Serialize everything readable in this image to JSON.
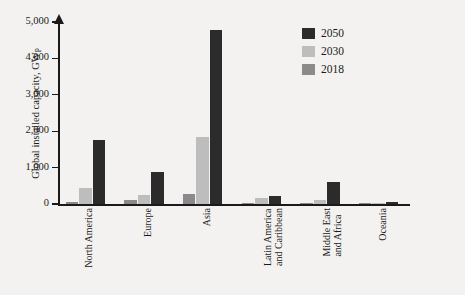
{
  "chart_data": {
    "type": "bar",
    "title": "",
    "xlabel": "",
    "ylabel": "Global installed capacity, GW",
    "ylabel_subscript": "P",
    "ylim": [
      0,
      5000
    ],
    "yticks": [
      0,
      1000,
      2000,
      3000,
      4000,
      5000
    ],
    "ytick_labels": [
      "0",
      "1,000",
      "2,000",
      "3,000",
      "4,000",
      "5,000"
    ],
    "grid": false,
    "legend_position": "top-right",
    "categories": [
      "North America",
      "Europe",
      "Asia",
      "Latin America and Caribbean",
      "Middle East and Africa",
      "Oceania"
    ],
    "category_lines": [
      [
        "North America"
      ],
      [
        "Europe"
      ],
      [
        "Asia"
      ],
      [
        "Latin America",
        "and Caribbean"
      ],
      [
        "Middle East",
        "and Africa"
      ],
      [
        "Oceania"
      ]
    ],
    "series": [
      {
        "name": "2018",
        "color": "#8a8a8a",
        "values": [
          62,
          115,
          265,
          7,
          12,
          11
        ]
      },
      {
        "name": "2030",
        "color": "#bdbdbd",
        "values": [
          430,
          245,
          1845,
          175,
          120,
          30
        ]
      },
      {
        "name": "2050",
        "color": "#2b2b2b",
        "values": [
          1745,
          880,
          4775,
          210,
          600,
          55
        ]
      }
    ],
    "series_draw_order": [
      "2018",
      "2030",
      "2050"
    ]
  },
  "legend": {
    "items": [
      {
        "label": "2050",
        "color": "#2b2b2b"
      },
      {
        "label": "2030",
        "color": "#bdbdbd"
      },
      {
        "label": "2018",
        "color": "#8a8a8a"
      }
    ]
  },
  "colors": {
    "background": "#f3f2f0",
    "axis": "#1a1a1a",
    "text": "#1a1a1a"
  }
}
